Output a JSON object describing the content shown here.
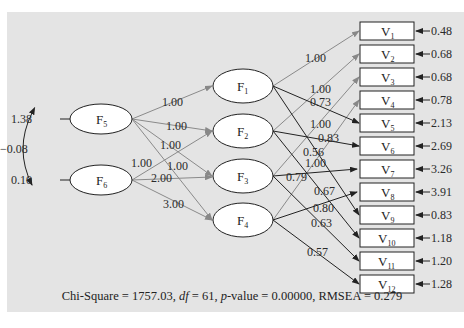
{
  "diagram": {
    "type": "structural-equation-model",
    "exogenous_factors": [
      {
        "id": "F5",
        "label": "F",
        "sub": "5",
        "variance": "1.38"
      },
      {
        "id": "F6",
        "label": "F",
        "sub": "6",
        "variance": "0.10"
      }
    ],
    "covariance": {
      "between": [
        "F5",
        "F6"
      ],
      "value": "−0.08"
    },
    "first_order_factors": [
      {
        "id": "F1",
        "label": "F",
        "sub": "1"
      },
      {
        "id": "F2",
        "label": "F",
        "sub": "2"
      },
      {
        "id": "F3",
        "label": "F",
        "sub": "3"
      },
      {
        "id": "F4",
        "label": "F",
        "sub": "4"
      }
    ],
    "structural_paths": [
      {
        "from": "F5",
        "to": "F1",
        "value": "1.00"
      },
      {
        "from": "F5",
        "to": "F2",
        "value": "1.00"
      },
      {
        "from": "F5",
        "to": "F3",
        "value": "1.00"
      },
      {
        "from": "F5",
        "to": "F4",
        "value": "1.00"
      },
      {
        "from": "F6",
        "to": "F2",
        "value": "1.00"
      },
      {
        "from": "F6",
        "to": "F3",
        "value": "2.00"
      },
      {
        "from": "F6",
        "to": "F4",
        "value": "3.00"
      }
    ],
    "observed": [
      {
        "id": "V1",
        "label": "V",
        "sub": "1",
        "error": "0.48"
      },
      {
        "id": "V2",
        "label": "V",
        "sub": "2",
        "error": "0.68"
      },
      {
        "id": "V3",
        "label": "V",
        "sub": "3",
        "error": "0.68"
      },
      {
        "id": "V4",
        "label": "V",
        "sub": "4",
        "error": "0.78"
      },
      {
        "id": "V5",
        "label": "V",
        "sub": "5",
        "error": "2.13"
      },
      {
        "id": "V6",
        "label": "V",
        "sub": "6",
        "error": "2.69"
      },
      {
        "id": "V7",
        "label": "V",
        "sub": "7",
        "error": "3.26"
      },
      {
        "id": "V8",
        "label": "V",
        "sub": "8",
        "error": "3.91"
      },
      {
        "id": "V9",
        "label": "V",
        "sub": "9",
        "error": "0.83"
      },
      {
        "id": "V10",
        "label": "V",
        "sub": "10",
        "error": "1.18"
      },
      {
        "id": "V11",
        "label": "V",
        "sub": "11",
        "error": "1.20"
      },
      {
        "id": "V12",
        "label": "V",
        "sub": "12",
        "error": "1.28"
      }
    ],
    "loadings": [
      {
        "from": "F1",
        "to": "V1",
        "value": "1.00"
      },
      {
        "from": "F2",
        "to": "V2",
        "value": "1.00"
      },
      {
        "from": "F3",
        "to": "V3",
        "value": "1.00"
      },
      {
        "from": "F4",
        "to": "V4",
        "value": "0.56"
      },
      {
        "from": "F1",
        "to": "V5",
        "value": "0.73"
      },
      {
        "from": "F2",
        "to": "V6",
        "value": "0.83"
      },
      {
        "from": "F3",
        "to": "V7",
        "value": "0.79"
      },
      {
        "from": "F4",
        "to": "V8",
        "value": "0.80"
      },
      {
        "from": "F1",
        "to": "V9",
        "value": "0.67"
      },
      {
        "from": "F2",
        "to": "V10",
        "value": "0.63"
      },
      {
        "from": "F3",
        "to": "V11",
        "value": "1.00"
      },
      {
        "from": "F4",
        "to": "V12",
        "value": "0.57"
      }
    ]
  },
  "fit": {
    "chi_label": "Chi-Square",
    "chi_value": "1757.03",
    "df_label": "df",
    "df_value": "61",
    "p_label": "p",
    "p_suffix": "-value",
    "p_value": "0.00000",
    "rmsea_label": "RMSEA",
    "rmsea_value": "0.279"
  }
}
